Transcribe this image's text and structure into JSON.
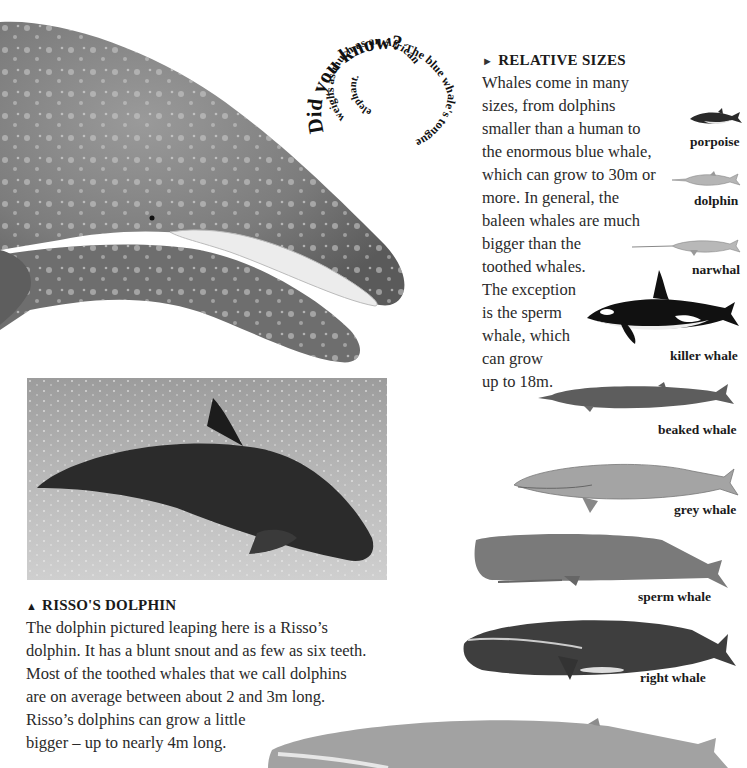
{
  "spiral_fact": {
    "lead": "Did you know?",
    "text": "The blue whale's tongue weighs as much as an African elephant."
  },
  "relative_sizes": {
    "heading_marker": "►",
    "heading": "RELATIVE SIZES",
    "lines": [
      "Whales come in many",
      "sizes, from dolphins",
      "smaller than a human to",
      "the enormous blue whale,",
      "which can grow to 30m or",
      "more. In general, the",
      "baleen whales are much",
      "bigger than the",
      "toothed whales.",
      "The exception",
      "is the sperm",
      "whale, which",
      "can grow",
      "up to 18m."
    ]
  },
  "species": [
    {
      "label": "porpoise"
    },
    {
      "label": "dolphin"
    },
    {
      "label": "narwhal"
    },
    {
      "label": "killer whale"
    },
    {
      "label": "beaked whale"
    },
    {
      "label": "grey whale"
    },
    {
      "label": "sperm whale"
    },
    {
      "label": "right whale"
    },
    {
      "label": "blue whale"
    }
  ],
  "risso": {
    "heading_marker": "▲",
    "heading": "RISSO'S DOLPHIN",
    "lines": [
      "The dolphin pictured leaping here is a Risso’s",
      "dolphin. It has a blunt snout and as few as six teeth.",
      "Most of the toothed whales that we call dolphins",
      "are on average between about 2 and 3m long.",
      "Risso’s dolphins can grow a little",
      "bigger – up to nearly 4m long."
    ]
  },
  "colors": {
    "text": "#2a2a2a",
    "whale_grey": "#8a8a8a",
    "orca_black": "#111111",
    "sea": "#b8b8b8"
  }
}
